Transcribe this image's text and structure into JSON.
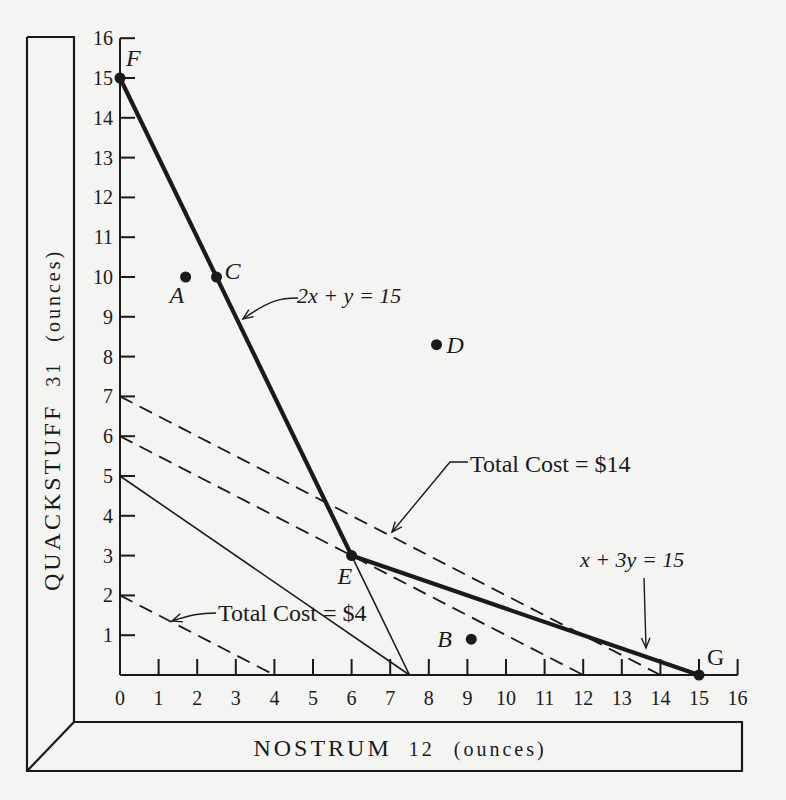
{
  "chart_data": {
    "type": "line",
    "title": "",
    "xlabel": "NOSTRUM 12 (ounces)",
    "ylabel": "QUACKSTUFF 31 (ounces)",
    "xlabel_parts": {
      "name": "NOSTRUM",
      "num": "12",
      "unit": "(ounces)"
    },
    "ylabel_parts": {
      "name": "QUACKSTUFF",
      "num": "31",
      "unit": "(ounces)"
    },
    "xlim": [
      0,
      16
    ],
    "ylim": [
      0,
      16
    ],
    "grid": false,
    "x_ticks": [
      0,
      1,
      2,
      3,
      4,
      5,
      6,
      7,
      8,
      9,
      10,
      11,
      12,
      13,
      14,
      15,
      16
    ],
    "y_ticks": [
      1,
      2,
      3,
      4,
      5,
      6,
      7,
      8,
      9,
      10,
      11,
      12,
      13,
      14,
      15,
      16
    ],
    "origin_label": "0",
    "series": [
      {
        "name": "2x + y = 15",
        "style": "thick",
        "points": [
          [
            0,
            15
          ],
          [
            6,
            3
          ]
        ]
      },
      {
        "name": "x + 3y = 15",
        "style": "thick",
        "points": [
          [
            6,
            3
          ],
          [
            15,
            0
          ]
        ]
      },
      {
        "name": "Total Cost = $14",
        "style": "dashed",
        "points": [
          [
            0,
            7
          ],
          [
            14,
            0
          ]
        ]
      },
      {
        "name": "Total Cost = $12",
        "style": "dashed",
        "points": [
          [
            0,
            6
          ],
          [
            12,
            0
          ]
        ]
      },
      {
        "name": "Cost line through E",
        "style": "solid-thin",
        "points": [
          [
            0,
            5
          ],
          [
            7.5,
            0
          ]
        ]
      },
      {
        "name": "Total Cost = $4",
        "style": "dashed",
        "points": [
          [
            0,
            2
          ],
          [
            4,
            0
          ]
        ]
      },
      {
        "name": "2x+y=15 extension",
        "style": "solid-thin",
        "points": [
          [
            6,
            3
          ],
          [
            7.5,
            0
          ]
        ]
      }
    ],
    "labeled_points": [
      {
        "label": "F",
        "x": 0,
        "y": 15,
        "dot": true
      },
      {
        "label": "A",
        "x": 1.7,
        "y": 10,
        "dot": true
      },
      {
        "label": "C",
        "x": 2.5,
        "y": 10,
        "dot": true
      },
      {
        "label": "D",
        "x": 8.2,
        "y": 8.3,
        "dot": true
      },
      {
        "label": "E",
        "x": 6,
        "y": 3,
        "dot": true
      },
      {
        "label": "B",
        "x": 9.1,
        "y": 0.9,
        "dot": true
      },
      {
        "label": "G",
        "x": 15,
        "y": 0,
        "dot": true
      }
    ],
    "annotations": [
      {
        "text": "2x + y = 15",
        "points_to": [
          2.7,
          8.8
        ]
      },
      {
        "text": "Total Cost = $14",
        "points_to": [
          7.4,
          3.5
        ]
      },
      {
        "text": "Total Cost = $4",
        "points_to": [
          1.3,
          1.4
        ]
      },
      {
        "text": "x + 3y = 15",
        "points_to": [
          13.7,
          0.5
        ]
      }
    ]
  }
}
